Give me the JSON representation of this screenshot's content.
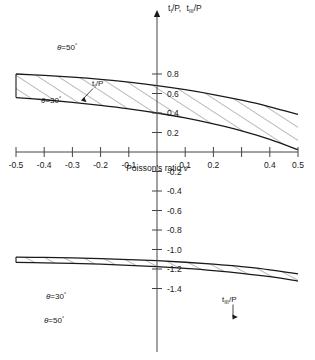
{
  "chart_data": {
    "type": "area",
    "title": "",
    "xlabel": "Poisson's ratio ν",
    "ylabel": "t₁/P,  t₃/P",
    "ylabel_parts": [
      {
        "base": "t",
        "sub": "I",
        "tail": "/P"
      },
      {
        "base": "t",
        "sub": "III",
        "tail": "/P"
      }
    ],
    "xlim": [
      -0.5,
      0.5
    ],
    "ylim": [
      -1.5,
      0.95
    ],
    "grid": false,
    "legend": "inline-annotations",
    "xticks": [
      -0.5,
      -0.4,
      -0.3,
      -0.2,
      -0.1,
      0,
      0.1,
      0.2,
      0.3,
      0.4,
      0.5
    ],
    "xtick_labels": [
      "-0.5",
      "-0.4",
      "-0.3",
      "-0.2",
      "-0.1",
      "",
      "0.1",
      "0.2",
      "",
      "0.4",
      "0.5"
    ],
    "yticks": [
      0.8,
      0.6,
      0.4,
      0.2,
      -0.2,
      -0.4,
      -0.6,
      -0.8,
      -1.0,
      -1.2,
      -1.4
    ],
    "ytick_labels": [
      "0.8",
      "0.6",
      "0.4",
      "0.2",
      "-0.2",
      "-0.4",
      "-0.6",
      "-0.8",
      "-1.0",
      "-1.2",
      "-1.4"
    ],
    "annotations": [
      {
        "text": "θ = 50°",
        "band": "upper",
        "edge": "upper",
        "x": -0.29,
        "y": 0.69
      },
      {
        "text": "θ = 30°",
        "band": "upper",
        "edge": "lower",
        "x": -0.32,
        "y": 0.4
      },
      {
        "text": "t₁/P",
        "band": "upper",
        "x": -0.1,
        "y": 0.49
      },
      {
        "text": "θ = 30°",
        "band": "lower",
        "edge": "upper",
        "x": -0.3,
        "y": -0.98
      },
      {
        "text": "θ = 50°",
        "band": "lower",
        "edge": "lower",
        "x": -0.31,
        "y": -1.15
      },
      {
        "text": "t₃/P",
        "band": "lower",
        "x": 0.21,
        "y": -1.04
      }
    ],
    "series": [
      {
        "name": "t_I/P, θ = 50°",
        "band": "upper",
        "edge": "upper",
        "x": [
          -0.5,
          -0.4,
          -0.3,
          -0.2,
          -0.1,
          0.0,
          0.1,
          0.2,
          0.3,
          0.4,
          0.5
        ],
        "values": [
          0.8,
          0.786,
          0.768,
          0.745,
          0.716,
          0.681,
          0.639,
          0.589,
          0.531,
          0.464,
          0.385
        ]
      },
      {
        "name": "t_I/P, θ = 30°",
        "band": "upper",
        "edge": "lower",
        "x": [
          -0.5,
          -0.4,
          -0.3,
          -0.2,
          -0.1,
          0.0,
          0.1,
          0.2,
          0.3,
          0.4,
          0.5
        ],
        "values": [
          0.558,
          0.536,
          0.51,
          0.479,
          0.443,
          0.4,
          0.349,
          0.288,
          0.216,
          0.129,
          0.023
        ]
      },
      {
        "name": "t_III/P, θ = 30°",
        "band": "lower",
        "edge": "upper",
        "x": [
          -0.5,
          -0.4,
          -0.3,
          -0.2,
          -0.1,
          0.0,
          0.1,
          0.2,
          0.3,
          0.4,
          0.5
        ],
        "values": [
          -1.078,
          -1.081,
          -1.086,
          -1.093,
          -1.103,
          -1.115,
          -1.131,
          -1.151,
          -1.176,
          -1.208,
          -1.25
        ]
      },
      {
        "name": "t_III/P, θ = 50°",
        "band": "lower",
        "edge": "lower",
        "x": [
          -0.5,
          -0.4,
          -0.3,
          -0.2,
          -0.1,
          0.0,
          0.1,
          0.2,
          0.3,
          0.4,
          0.5
        ],
        "values": [
          -1.133,
          -1.137,
          -1.143,
          -1.151,
          -1.162,
          -1.176,
          -1.194,
          -1.216,
          -1.244,
          -1.279,
          -1.324
        ]
      }
    ],
    "colors": {
      "line": "#1a1a1a",
      "hatch": "#555555",
      "axis": "#444444",
      "background": "#ffffff"
    }
  }
}
